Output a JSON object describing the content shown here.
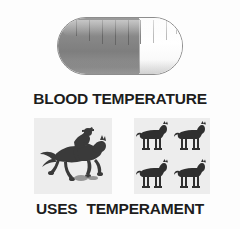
{
  "figure": {
    "background_color": "#fdfdfd",
    "ink_color": "#1d1d1d"
  },
  "capsule": {
    "name": "capsule-pill",
    "dark_color": "#868686",
    "light_color": "#ffffff",
    "outline_color": "#8d8d8d",
    "dark_fraction_percent": 65,
    "tick_marks": 9
  },
  "labels": {
    "top": "BLOOD TEMPERATURE",
    "bottom_left": "USES",
    "bottom_right": "TEMPERAMENT"
  },
  "panels": {
    "rider": {
      "name": "galloping-horse-and-rider",
      "background_color": "#ededed",
      "silhouette_color": "#3a3a3a"
    },
    "herd": {
      "name": "four-standing-horses",
      "background_color": "#ededed",
      "silhouette_color": "#2f2f2f",
      "count": 4
    }
  }
}
